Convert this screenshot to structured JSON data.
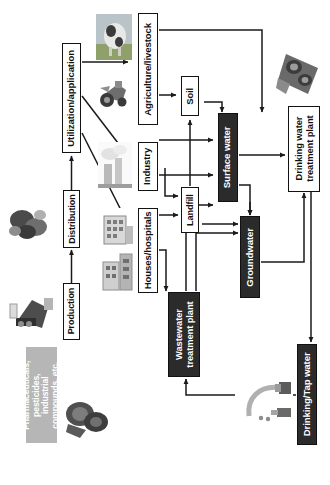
{
  "diagram": {
    "orientation": "rotated-90-ccw",
    "colors": {
      "dark_node": "#2b2b2b",
      "white_node": "#ffffff",
      "gray_node": "#b6b6b6",
      "outline": "#121212",
      "connector": "#1a1a1a"
    },
    "nodes": [
      {
        "id": "sources",
        "label": "Pharmaceuticals, pesticides, industrial compounds, etc.",
        "lines": [
          "Pharmaceuticals,",
          "pesticides,",
          "industrial",
          "compounds, etc."
        ],
        "style": "gray"
      },
      {
        "id": "production",
        "label": "Production",
        "style": "white"
      },
      {
        "id": "distribution",
        "label": "Distribution",
        "style": "white"
      },
      {
        "id": "utilization",
        "label": "Utilization/application",
        "style": "white"
      },
      {
        "id": "agriculture",
        "label": "Agriculture/livestock",
        "style": "white"
      },
      {
        "id": "industry",
        "label": "Industry",
        "style": "white"
      },
      {
        "id": "houses",
        "label": "Houses/hospitals",
        "style": "white"
      },
      {
        "id": "soil",
        "label": "Soil",
        "style": "white"
      },
      {
        "id": "landfill",
        "label": "Landfill",
        "style": "white"
      },
      {
        "id": "surface",
        "label": "Surface water",
        "style": "dark"
      },
      {
        "id": "ground",
        "label": "Groundwater",
        "style": "dark"
      },
      {
        "id": "wwtp",
        "label": "Wastewater treatment plant",
        "lines": [
          "Wastewater",
          "treatment plant"
        ],
        "style": "dark"
      },
      {
        "id": "dwtp",
        "label": "Drinking water treatment plant",
        "lines": [
          "Drinking water",
          "treatment plant"
        ],
        "style": "white"
      },
      {
        "id": "tap",
        "label": "Drinking/Tap water",
        "style": "dark"
      }
    ],
    "photos": [
      {
        "id": "photo-cow",
        "name": "cow-photo"
      },
      {
        "id": "photo-tractor",
        "name": "tractor-photo"
      },
      {
        "id": "photo-factory",
        "name": "factory-photo"
      },
      {
        "id": "photo-hospital",
        "name": "hospital-building-photo"
      },
      {
        "id": "photo-houses",
        "name": "houses-photo"
      },
      {
        "id": "photo-pills",
        "name": "pills-photo"
      },
      {
        "id": "photo-lab",
        "name": "laboratory-photo"
      },
      {
        "id": "photo-tanks",
        "name": "wastewater-tanks-photo"
      },
      {
        "id": "photo-clarifier",
        "name": "treatment-clarifier-photo"
      },
      {
        "id": "photo-faucet",
        "name": "faucet-photo"
      }
    ],
    "edges": [
      {
        "from": "production",
        "to": "distribution"
      },
      {
        "from": "distribution",
        "to": "utilization"
      },
      {
        "from": "utilization",
        "to": "agriculture"
      },
      {
        "from": "utilization",
        "to": "industry"
      },
      {
        "from": "utilization",
        "to": "houses"
      },
      {
        "from": "agriculture",
        "to": "soil"
      },
      {
        "from": "agriculture",
        "to": "surface"
      },
      {
        "from": "agriculture",
        "to": "ground"
      },
      {
        "from": "soil",
        "to": "ground"
      },
      {
        "from": "industry",
        "to": "surface"
      },
      {
        "from": "industry",
        "to": "landfill"
      },
      {
        "from": "houses",
        "to": "wwtp"
      },
      {
        "from": "houses",
        "to": "landfill"
      },
      {
        "from": "landfill",
        "to": "soil"
      },
      {
        "from": "landfill",
        "to": "ground"
      },
      {
        "from": "wwtp",
        "to": "surface"
      },
      {
        "from": "wwtp",
        "to": "ground"
      },
      {
        "from": "surface",
        "to": "dwtp"
      },
      {
        "from": "surface",
        "to": "ground"
      },
      {
        "from": "ground",
        "to": "dwtp"
      },
      {
        "from": "dwtp",
        "to": "tap"
      },
      {
        "from": "tap",
        "to": "wwtp"
      }
    ]
  }
}
